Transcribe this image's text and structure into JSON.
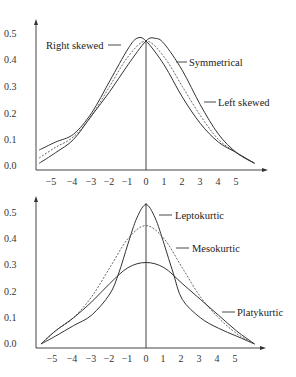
{
  "chart_data": [
    {
      "type": "line",
      "title": "Skewness",
      "xlabel": "",
      "ylabel": "",
      "xlim": [
        -5.9,
        6.2
      ],
      "ylim": [
        0.0,
        0.55
      ],
      "x_ticks": [
        -5,
        -4,
        -3,
        -2,
        -1,
        0,
        1,
        2,
        3,
        4,
        5
      ],
      "y_ticks": [
        "0.0",
        "0.1",
        "0.2",
        "0.3",
        "0.4",
        "0.5"
      ],
      "grid": false,
      "series": [
        {
          "name": "Right skewed",
          "style": "solid",
          "x": [
            -5.9,
            -5,
            -4,
            -3,
            -2,
            -1,
            -0.5,
            0,
            1,
            2,
            3,
            4,
            5,
            6.0
          ],
          "y": [
            0.06,
            0.09,
            0.12,
            0.2,
            0.32,
            0.44,
            0.48,
            0.47,
            0.38,
            0.26,
            0.16,
            0.09,
            0.05,
            0.01
          ]
        },
        {
          "name": "Symmetrical",
          "style": "dotted",
          "x": [
            -5.9,
            -5,
            -4,
            -3,
            -2,
            -1,
            0,
            1,
            2,
            3,
            4,
            5,
            6.0
          ],
          "y": [
            0.03,
            0.07,
            0.11,
            0.19,
            0.3,
            0.41,
            0.47,
            0.41,
            0.3,
            0.19,
            0.1,
            0.05,
            0.01
          ]
        },
        {
          "name": "Left skewed",
          "style": "solid",
          "x": [
            -5.9,
            -5,
            -4,
            -3,
            -2,
            -1,
            0,
            0.5,
            1,
            2,
            3,
            4,
            5,
            6.0
          ],
          "y": [
            0.01,
            0.05,
            0.1,
            0.19,
            0.28,
            0.38,
            0.47,
            0.48,
            0.46,
            0.36,
            0.23,
            0.12,
            0.05,
            0.01
          ]
        }
      ],
      "annotations": [
        {
          "text": "Right skewed",
          "x": -1.8,
          "y": 0.47
        },
        {
          "text": "Symmetrical",
          "x": 1.9,
          "y": 0.4
        },
        {
          "text": "Left skewed",
          "x": 3.4,
          "y": 0.24
        }
      ]
    },
    {
      "type": "line",
      "title": "Kurtosis",
      "xlabel": "",
      "ylabel": "",
      "xlim": [
        -5.9,
        6.2
      ],
      "ylim": [
        0.0,
        0.55
      ],
      "x_ticks": [
        -5,
        -4,
        -3,
        -2,
        -1,
        0,
        1,
        2,
        3,
        4,
        5
      ],
      "y_ticks": [
        "0.0",
        "0.1",
        "0.2",
        "0.3",
        "0.4",
        "0.5"
      ],
      "grid": false,
      "series": [
        {
          "name": "Leptokurtic",
          "style": "solid",
          "x": [
            -5.8,
            -5,
            -4,
            -3,
            -2,
            -1.5,
            -1,
            -0.5,
            0,
            0.5,
            1,
            1.5,
            2,
            3,
            4,
            5,
            6.0
          ],
          "y": [
            0.0,
            0.03,
            0.07,
            0.11,
            0.19,
            0.27,
            0.38,
            0.48,
            0.53,
            0.48,
            0.38,
            0.27,
            0.17,
            0.1,
            0.06,
            0.03,
            0.0
          ]
        },
        {
          "name": "Mesokurtic",
          "style": "dotted",
          "x": [
            -5.8,
            -5,
            -4,
            -3,
            -2,
            -1,
            0,
            1,
            2,
            3,
            4,
            5,
            6.0
          ],
          "y": [
            0.0,
            0.05,
            0.1,
            0.18,
            0.29,
            0.4,
            0.45,
            0.4,
            0.29,
            0.18,
            0.1,
            0.04,
            0.0
          ]
        },
        {
          "name": "Platykurtic",
          "style": "solid",
          "x": [
            -5.8,
            -5,
            -4,
            -3,
            -2,
            -1,
            0,
            1,
            2,
            3,
            4,
            5,
            6.0
          ],
          "y": [
            0.0,
            0.05,
            0.1,
            0.16,
            0.23,
            0.29,
            0.31,
            0.29,
            0.23,
            0.17,
            0.11,
            0.05,
            0.0
          ]
        }
      ],
      "annotations": [
        {
          "text": "Leptokurtic",
          "x": 1.3,
          "y": 0.51
        },
        {
          "text": "Mesokurtic",
          "x": 2.1,
          "y": 0.39
        },
        {
          "text": "Platykurtic",
          "x": 3.9,
          "y": 0.12
        }
      ]
    }
  ],
  "labels": {
    "top": {
      "right_skewed": "Right skewed",
      "symmetrical": "Symmetrical",
      "left_skewed": "Left skewed"
    },
    "bottom": {
      "leptokurtic": "Leptokurtic",
      "mesokurtic": "Mesokurtic",
      "platykurtic": "Platykurtic"
    },
    "x_ticks": [
      "−5",
      "−4",
      "−3",
      "−2",
      "−1",
      "0",
      "1",
      "2",
      "3",
      "4",
      "5"
    ],
    "y_ticks": [
      "0.0",
      "0.1",
      "0.2",
      "0.3",
      "0.4",
      "0.5"
    ]
  }
}
